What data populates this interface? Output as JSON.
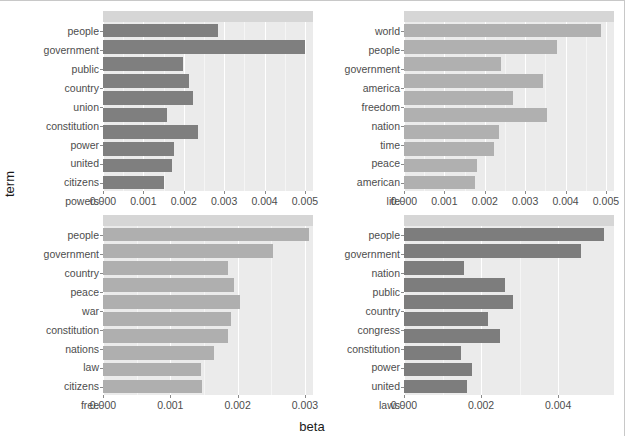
{
  "chart_data": {
    "type": "bar",
    "title": "",
    "xlabel": "beta",
    "ylabel": "term",
    "orientation": "horizontal",
    "layout": "facet-grid-2x2",
    "grid": true,
    "legend": null,
    "panel_background": "#EBEBEB",
    "strip_background": "#D6D6D6",
    "panels": [
      {
        "id": "topic-1",
        "position": "top-left",
        "strip_label": "",
        "color": "#7F7F7F",
        "xlim": [
          0,
          0.0052
        ],
        "xticks": [
          0.0,
          0.001,
          0.002,
          0.003,
          0.004,
          0.005
        ],
        "xtick_labels": [
          "0.000",
          "0.001",
          "0.002",
          "0.003",
          "0.004",
          "0.005"
        ],
        "categories": [
          "people",
          "government",
          "public",
          "country",
          "union",
          "constitution",
          "power",
          "united",
          "citizens",
          "powers"
        ],
        "values": [
          0.00284,
          0.005,
          0.00197,
          0.00213,
          0.00224,
          0.00159,
          0.00235,
          0.00176,
          0.00172,
          0.00152
        ]
      },
      {
        "id": "topic-2",
        "position": "top-right",
        "strip_label": "",
        "color": "#B0B0B0",
        "xlim": [
          0,
          0.0052
        ],
        "xticks": [
          0.0,
          0.001,
          0.002,
          0.003,
          0.004,
          0.005
        ],
        "xtick_labels": [
          "0.000",
          "0.001",
          "0.002",
          "0.003",
          "0.004",
          "0.005"
        ],
        "categories": [
          "world",
          "people",
          "government",
          "america",
          "freedom",
          "nation",
          "time",
          "peace",
          "american",
          "life"
        ],
        "values": [
          0.00489,
          0.0038,
          0.00239,
          0.00345,
          0.00269,
          0.00353,
          0.00235,
          0.00224,
          0.0018,
          0.00176
        ]
      },
      {
        "id": "topic-3",
        "position": "bottom-left",
        "strip_label": "",
        "color": "#AFAFAF",
        "xlim": [
          0,
          0.00312
        ],
        "xticks": [
          0.0,
          0.001,
          0.002,
          0.003
        ],
        "xtick_labels": [
          "0.000",
          "0.001",
          "0.002",
          "0.003"
        ],
        "categories": [
          "people",
          "government",
          "country",
          "peace",
          "war",
          "constitution",
          "nations",
          "law",
          "citizens",
          "free"
        ],
        "values": [
          0.00306,
          0.00253,
          0.00186,
          0.00195,
          0.00204,
          0.0019,
          0.00186,
          0.00165,
          0.00145,
          0.00147
        ]
      },
      {
        "id": "topic-4",
        "position": "bottom-right",
        "strip_label": "",
        "color": "#7D7D7D",
        "xlim": [
          0,
          0.00545
        ],
        "xticks": [
          0.0,
          0.002,
          0.004
        ],
        "xtick_labels": [
          "0.000",
          "0.002",
          "0.004"
        ],
        "categories": [
          "people",
          "government",
          "nation",
          "public",
          "country",
          "congress",
          "constitution",
          "power",
          "united",
          "laws"
        ],
        "values": [
          0.00518,
          0.0046,
          0.00155,
          0.00263,
          0.00283,
          0.00218,
          0.0025,
          0.00148,
          0.00176,
          0.00163
        ]
      }
    ]
  }
}
